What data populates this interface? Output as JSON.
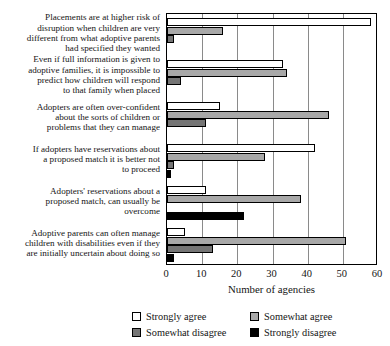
{
  "chart_data": {
    "type": "bar",
    "orientation": "horizontal",
    "title": "",
    "xlabel": "Number of agencies",
    "ylabel": "",
    "xlim": [
      0,
      60
    ],
    "xticks": [
      0,
      10,
      20,
      30,
      40,
      50,
      60
    ],
    "grid": "vertical",
    "legend_position": "bottom",
    "categories": [
      "Placements are at higher risk of disruption when children are very different from what adoptive parents had specified they wanted",
      "Even if full information is given to adoptive families, it is impossible to predict how children will respond to that family when placed",
      "Adopters are often over-confident about the sorts of children or problems that they can manage",
      "If adopters have reservations about a proposed match it is better not to proceed",
      "Adopters' reservations about a proposed match, can usually be overcome",
      "Adoptive parents can often manage children with disabilities even if they are initially uncertain about doing so"
    ],
    "category_lines": [
      [
        "Placements are at higher risk of",
        "disruption when children are very",
        "different from what adoptive parents",
        "had specified they wanted"
      ],
      [
        "Even if full information is given to",
        "adoptive families, it is impossible to",
        "predict how children will respond",
        "to that family when placed"
      ],
      [
        "Adopters are often over-confident",
        "about the sorts of children or",
        "problems that they can manage"
      ],
      [
        "If adopters have reservations about",
        "a proposed match it is better not",
        "to proceed"
      ],
      [
        "Adopters' reservations about a",
        "proposed match, can usually be",
        "overcome"
      ],
      [
        "Adoptive parents can often manage",
        "children with disabilities even if they",
        "are initially uncertain about doing so"
      ]
    ],
    "series": [
      {
        "name": "Strongly agree",
        "color": "#ffffff",
        "values": [
          58,
          33,
          15,
          42,
          11,
          5
        ]
      },
      {
        "name": "Somewhat agree",
        "color": "#a8a8a8",
        "values": [
          16,
          34,
          46,
          28,
          38,
          51
        ]
      },
      {
        "name": "Somewhat disagree",
        "color": "#757575",
        "values": [
          2,
          4,
          11,
          2,
          0,
          13
        ]
      },
      {
        "name": "Strongly disagree",
        "color": "#000000",
        "values": [
          0,
          0,
          0,
          1,
          22,
          2
        ]
      }
    ]
  }
}
